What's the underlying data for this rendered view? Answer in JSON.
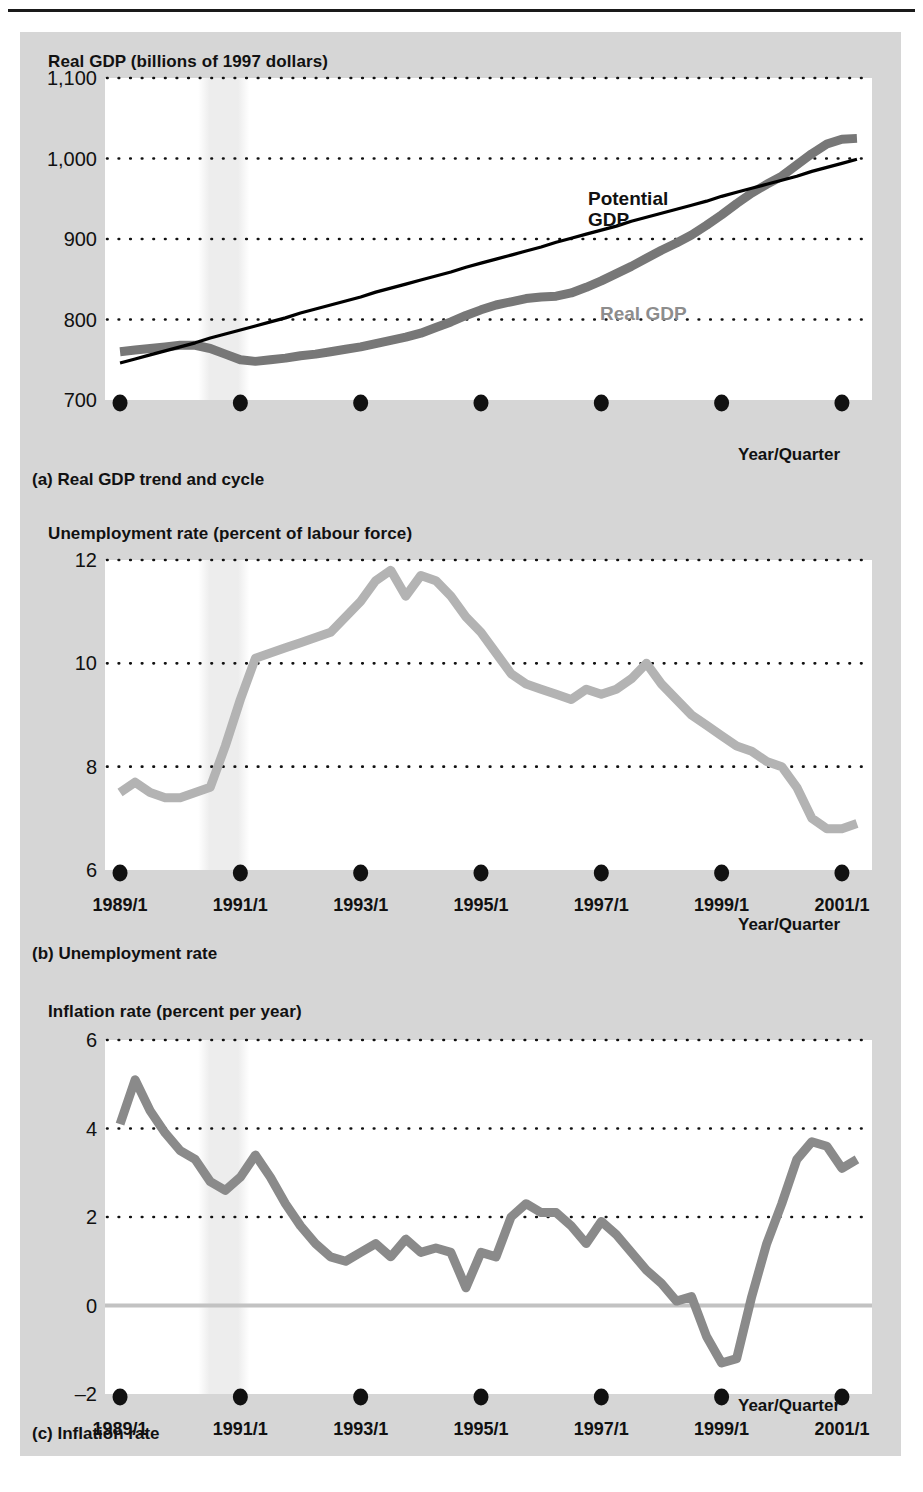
{
  "figure": {
    "background_color": "#d6d6d6",
    "plot_background_color": "#ffffff",
    "recession_shade_color": "#ededed"
  },
  "charts": [
    {
      "id": "real-gdp",
      "axis_title": "Real GDP (billions of 1997 dollars)",
      "caption": "(a) Real GDP trend and cycle",
      "xaxis_label": "Year/Quarter",
      "series_labels": {
        "potential": "Potential\nGDP",
        "potential_line1": "Potential",
        "potential_line2": "GDP",
        "real": "Real GDP"
      },
      "colors": {
        "real": "#777777",
        "potential": "#000000"
      }
    },
    {
      "id": "unemployment-rate",
      "axis_title": "Unemployment rate (percent of labour force)",
      "caption": "(b) Unemployment rate",
      "xaxis_label": "Year/Quarter",
      "colors": {
        "rate": "#b3b3b3"
      }
    },
    {
      "id": "inflation-rate",
      "axis_title": "Inflation rate (percent per year)",
      "caption": "(c) Inflation rate",
      "xaxis_label": "Year/Quarter",
      "colors": {
        "rate": "#8a8a8a",
        "zero_line": "#c2c2c2"
      }
    }
  ],
  "xticks": [
    "1989/1",
    "1991/1",
    "1993/1",
    "1995/1",
    "1997/1",
    "1999/1",
    "2001/1"
  ],
  "chart_data": [
    {
      "type": "line",
      "id": "real-gdp",
      "title": "Real GDP (billions of 1997 dollars)",
      "subtitle": "(a) Real GDP trend and cycle",
      "xlabel": "Year/Quarter",
      "ylabel": "Real GDP (billions of 1997 dollars)",
      "ylim": [
        700,
        1100
      ],
      "yticks": [
        700,
        800,
        900,
        1000,
        1100
      ],
      "ytick_labels": [
        "700",
        "800",
        "900",
        "1,000",
        "1,100"
      ],
      "xlim": [
        1988.75,
        2001.5
      ],
      "xticks": [
        1989,
        1991,
        1993,
        1995,
        1997,
        1999,
        2001
      ],
      "xtick_labels": [
        "1989/1",
        "1991/1",
        "1993/1",
        "1995/1",
        "1997/1",
        "1999/1",
        "2001/1"
      ],
      "grid": "horizontal-dotted",
      "legend": "inline-annotations",
      "annotations": [
        {
          "text": "Potential GDP",
          "x": 1996.1,
          "y": 960
        },
        {
          "text": "Real GDP",
          "x": 1996.4,
          "y": 828
        }
      ],
      "shaded_region": {
        "label": "recession",
        "x_start": 1990.3,
        "x_end": 1991.15
      },
      "x": [
        1989.0,
        1989.25,
        1989.5,
        1989.75,
        1990.0,
        1990.25,
        1990.5,
        1990.75,
        1991.0,
        1991.25,
        1991.5,
        1991.75,
        1992.0,
        1992.25,
        1992.5,
        1992.75,
        1993.0,
        1993.25,
        1993.5,
        1993.75,
        1994.0,
        1994.25,
        1994.5,
        1994.75,
        1995.0,
        1995.25,
        1995.5,
        1995.75,
        1996.0,
        1996.25,
        1996.5,
        1996.75,
        1997.0,
        1997.25,
        1997.5,
        1997.75,
        1998.0,
        1998.25,
        1998.5,
        1998.75,
        1999.0,
        1999.25,
        1999.5,
        1999.75,
        2000.0,
        2000.25,
        2000.5,
        2000.75,
        2001.0,
        2001.25
      ],
      "series": [
        {
          "name": "Real GDP",
          "color": "#777777",
          "values": [
            760,
            762,
            764,
            766,
            768,
            768,
            764,
            757,
            750,
            748,
            750,
            752,
            755,
            757,
            760,
            763,
            766,
            770,
            774,
            778,
            783,
            790,
            797,
            805,
            812,
            818,
            822,
            826,
            828,
            829,
            833,
            840,
            848,
            857,
            866,
            876,
            886,
            895,
            905,
            917,
            930,
            944,
            957,
            968,
            978,
            992,
            1006,
            1018,
            1024,
            1025
          ]
        },
        {
          "name": "Potential GDP",
          "color": "#000000",
          "values": [
            746,
            751,
            756,
            761,
            766,
            771,
            777,
            782,
            787,
            792,
            797,
            802,
            808,
            813,
            818,
            823,
            828,
            834,
            839,
            844,
            849,
            854,
            859,
            865,
            870,
            875,
            880,
            885,
            890,
            896,
            901,
            906,
            911,
            916,
            922,
            927,
            932,
            937,
            942,
            947,
            953,
            958,
            963,
            968,
            973,
            978,
            984,
            989,
            994,
            999
          ]
        }
      ]
    },
    {
      "type": "line",
      "id": "unemployment-rate",
      "title": "Unemployment rate (percent of labour force)",
      "subtitle": "(b) Unemployment rate",
      "xlabel": "Year/Quarter",
      "ylabel": "Unemployment rate (percent of labour force)",
      "ylim": [
        6,
        12
      ],
      "yticks": [
        6,
        8,
        10,
        12
      ],
      "ytick_labels": [
        "6",
        "8",
        "10",
        "12"
      ],
      "xlim": [
        1988.75,
        2001.5
      ],
      "xticks": [
        1989,
        1991,
        1993,
        1995,
        1997,
        1999,
        2001
      ],
      "xtick_labels": [
        "1989/1",
        "1991/1",
        "1993/1",
        "1995/1",
        "1997/1",
        "1999/1",
        "2001/1"
      ],
      "grid": "horizontal-dotted",
      "shaded_region": {
        "label": "recession",
        "x_start": 1990.3,
        "x_end": 1991.15
      },
      "x": [
        1989.0,
        1989.25,
        1989.5,
        1989.75,
        1990.0,
        1990.25,
        1990.5,
        1990.75,
        1991.0,
        1991.25,
        1991.5,
        1991.75,
        1992.0,
        1992.25,
        1992.5,
        1992.75,
        1993.0,
        1993.25,
        1993.5,
        1993.75,
        1994.0,
        1994.25,
        1994.5,
        1994.75,
        1995.0,
        1995.25,
        1995.5,
        1995.75,
        1996.0,
        1996.25,
        1996.5,
        1996.75,
        1997.0,
        1997.25,
        1997.5,
        1997.75,
        1998.0,
        1998.25,
        1998.5,
        1998.75,
        1999.0,
        1999.25,
        1999.5,
        1999.75,
        2000.0,
        2000.25,
        2000.5,
        2000.75,
        2001.0,
        2001.25
      ],
      "series": [
        {
          "name": "Unemployment rate",
          "color": "#b3b3b3",
          "values": [
            7.5,
            7.7,
            7.5,
            7.4,
            7.4,
            7.5,
            7.6,
            8.4,
            9.3,
            10.1,
            10.2,
            10.3,
            10.4,
            10.5,
            10.6,
            10.9,
            11.2,
            11.6,
            11.8,
            11.3,
            11.7,
            11.6,
            11.3,
            10.9,
            10.6,
            10.2,
            9.8,
            9.6,
            9.5,
            9.4,
            9.3,
            9.5,
            9.4,
            9.5,
            9.7,
            10.0,
            9.6,
            9.3,
            9.0,
            8.8,
            8.6,
            8.4,
            8.3,
            8.1,
            8.0,
            7.6,
            7.0,
            6.8,
            6.8,
            6.9
          ]
        }
      ]
    },
    {
      "type": "line",
      "id": "inflation-rate",
      "title": "Inflation rate (percent per year)",
      "subtitle": "(c) Inflation rate",
      "xlabel": "Year/Quarter",
      "ylabel": "Inflation rate (percent per year)",
      "ylim": [
        -2,
        6
      ],
      "yticks": [
        -2,
        0,
        2,
        4,
        6
      ],
      "ytick_labels": [
        "–2",
        "0",
        "2",
        "4",
        "6"
      ],
      "xlim": [
        1988.75,
        2001.5
      ],
      "xticks": [
        1989,
        1991,
        1993,
        1995,
        1997,
        1999,
        2001
      ],
      "xtick_labels": [
        "1989/1",
        "1991/1",
        "1993/1",
        "1995/1",
        "1997/1",
        "1999/1",
        "2001/1"
      ],
      "grid": "horizontal-dotted",
      "zero_line": true,
      "shaded_region": {
        "label": "recession",
        "x_start": 1990.3,
        "x_end": 1991.15
      },
      "x": [
        1989.0,
        1989.25,
        1989.5,
        1989.75,
        1990.0,
        1990.25,
        1990.5,
        1990.75,
        1991.0,
        1991.25,
        1991.5,
        1991.75,
        1992.0,
        1992.25,
        1992.5,
        1992.75,
        1993.0,
        1993.25,
        1993.5,
        1993.75,
        1994.0,
        1994.25,
        1994.5,
        1994.75,
        1995.0,
        1995.25,
        1995.5,
        1995.75,
        1996.0,
        1996.25,
        1996.5,
        1996.75,
        1997.0,
        1997.25,
        1997.5,
        1997.75,
        1998.0,
        1998.25,
        1998.5,
        1998.75,
        1999.0,
        1999.25,
        1999.5,
        1999.75,
        2000.0,
        2000.25,
        2000.5,
        2000.75,
        2001.0,
        2001.25
      ],
      "series": [
        {
          "name": "Inflation rate",
          "color": "#8a8a8a",
          "values": [
            4.1,
            5.1,
            4.4,
            3.9,
            3.5,
            3.3,
            2.8,
            2.6,
            2.9,
            3.4,
            2.9,
            2.3,
            1.8,
            1.4,
            1.1,
            1.0,
            1.2,
            1.4,
            1.1,
            1.5,
            1.2,
            1.3,
            1.2,
            0.4,
            1.2,
            1.1,
            2.0,
            2.3,
            2.1,
            2.1,
            1.8,
            1.4,
            1.9,
            1.6,
            1.2,
            0.8,
            0.5,
            0.1,
            0.2,
            -0.7,
            -1.3,
            -1.2,
            0.2,
            1.4,
            2.3,
            3.3,
            3.7,
            3.6,
            3.1,
            3.3
          ]
        }
      ]
    }
  ]
}
